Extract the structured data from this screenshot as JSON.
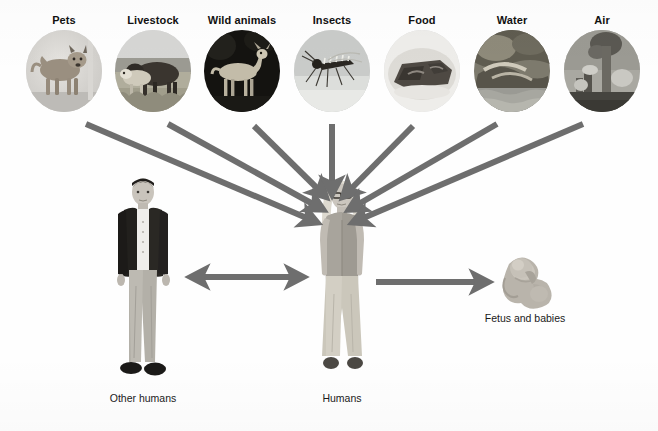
{
  "figure": {
    "background_color": "#fefefe",
    "arrow_color": "#6e6e6e",
    "label_color": "#111111"
  },
  "sources": [
    {
      "id": "pets",
      "label": "Pets",
      "icon": "dog-photo-icon",
      "x": 18,
      "y": 14
    },
    {
      "id": "livestock",
      "label": "Livestock",
      "icon": "cattle-photo-icon",
      "x": 107,
      "y": 14
    },
    {
      "id": "wild-animals",
      "label": "Wild animals",
      "icon": "deer-photo-icon",
      "x": 196,
      "y": 14
    },
    {
      "id": "insects",
      "label": "Insects",
      "icon": "mosquito-photo-icon",
      "x": 286,
      "y": 14
    },
    {
      "id": "food",
      "label": "Food",
      "icon": "meat-photo-icon",
      "x": 376,
      "y": 14
    },
    {
      "id": "water",
      "label": "Water",
      "icon": "stream-photo-icon",
      "x": 466,
      "y": 14
    },
    {
      "id": "air",
      "label": "Air",
      "icon": "smokestack-photo-icon",
      "x": 556,
      "y": 14
    }
  ],
  "figures": [
    {
      "id": "other-humans",
      "label": "Other humans",
      "icon": "standing-man-photo-icon",
      "x": 88,
      "y": 176
    },
    {
      "id": "humans",
      "label": "Humans",
      "icon": "standing-woman-photo-icon",
      "x": 292,
      "y": 176
    },
    {
      "id": "fetus-and-babies",
      "label": "Fetus and babies",
      "icon": "fetus-photo-icon",
      "x": 470,
      "y": 248
    }
  ],
  "arrows": [
    {
      "id": "arrow-pets-to-humans",
      "from": "pets",
      "to": "humans",
      "kind": "single"
    },
    {
      "id": "arrow-livestock-to-humans",
      "from": "livestock",
      "to": "humans",
      "kind": "single"
    },
    {
      "id": "arrow-wild-animals-to-humans",
      "from": "wild-animals",
      "to": "humans",
      "kind": "single"
    },
    {
      "id": "arrow-insects-to-humans",
      "from": "insects",
      "to": "humans",
      "kind": "single"
    },
    {
      "id": "arrow-food-to-humans",
      "from": "food",
      "to": "humans",
      "kind": "single"
    },
    {
      "id": "arrow-water-to-humans",
      "from": "water",
      "to": "humans",
      "kind": "single"
    },
    {
      "id": "arrow-air-to-humans",
      "from": "air",
      "to": "humans",
      "kind": "single"
    },
    {
      "id": "arrow-other-humans-humans",
      "from": "other-humans",
      "to": "humans",
      "kind": "double"
    },
    {
      "id": "arrow-humans-to-fetus",
      "from": "humans",
      "to": "fetus-and-babies",
      "kind": "single"
    }
  ]
}
